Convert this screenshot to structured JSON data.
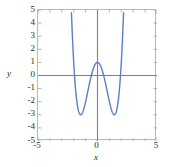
{
  "chart_data": {
    "type": "line",
    "title": "",
    "subtitle": "",
    "xlabel": "x",
    "ylabel": "y",
    "xlim": [
      -5,
      5
    ],
    "ylim": [
      -5,
      5
    ],
    "grid": false,
    "legend": null,
    "axis_lines": {
      "x_axis_at_y": 0,
      "y_axis_at_x": 0,
      "color": "#808080"
    },
    "x_ticks_major": [
      -5,
      0,
      5
    ],
    "x_tick_labels": [
      "-5",
      "0",
      "5"
    ],
    "x_ticks_minor": [
      -4,
      -3,
      -2,
      -1,
      1,
      2,
      3,
      4
    ],
    "y_ticks_major": [
      -5,
      -4,
      -3,
      -2,
      -1,
      0,
      1,
      2,
      3,
      4,
      5
    ],
    "y_tick_labels": [
      "-5",
      "-4",
      "-3",
      "-2",
      "-1",
      "0",
      "1",
      "2",
      "3",
      "4",
      "5"
    ],
    "series": [
      {
        "name": "y = x^4 - 4x^2 + 1",
        "color": "#5a7fc4",
        "linewidth": 1.4,
        "expression": "x**4 - 4*x**2 + 1",
        "x": [
          -2.07,
          -2.0,
          -1.9,
          -1.8,
          -1.7,
          -1.6,
          -1.5,
          -1.4142,
          -1.3,
          -1.2,
          -1.1,
          -1.0,
          -0.9,
          -0.8,
          -0.7,
          -0.6,
          -0.5,
          -0.4,
          -0.3,
          -0.2,
          -0.1,
          0.0,
          0.1,
          0.2,
          0.3,
          0.4,
          0.5,
          0.6,
          0.7,
          0.8,
          0.9,
          1.0,
          1.1,
          1.2,
          1.3,
          1.4142,
          1.5,
          1.6,
          1.7,
          1.8,
          1.9,
          2.0,
          2.07
        ],
        "y": [
          5.23,
          1.0,
          -1.41,
          -2.47,
          -2.81,
          -2.69,
          -2.19,
          -3.0,
          -1.9,
          -2.69,
          -2.37,
          -2.0,
          -1.58,
          -1.15,
          -0.72,
          -0.31,
          0.06,
          0.38,
          0.65,
          0.84,
          0.96,
          1.0,
          0.96,
          0.84,
          0.65,
          0.38,
          0.06,
          -0.31,
          -0.72,
          -1.15,
          -1.58,
          -2.0,
          -2.37,
          -2.69,
          -1.9,
          -3.0,
          -2.19,
          -2.69,
          -2.81,
          -2.47,
          -1.41,
          1.0,
          5.23
        ],
        "key_points": {
          "local_maximum": [
            0,
            1
          ],
          "local_minima": [
            [
              -1.4142,
              -3
            ],
            [
              1.4142,
              -3
            ]
          ],
          "x_intercepts": [
            -1.932,
            -0.518,
            0.518,
            1.932
          ]
        }
      }
    ]
  },
  "axes": {
    "y_label": "y",
    "x_label": "x"
  }
}
